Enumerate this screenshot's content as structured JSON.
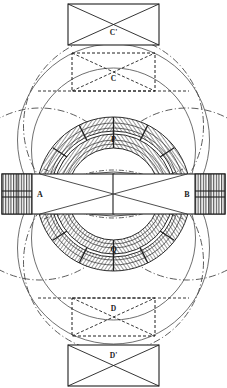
{
  "figure": {
    "caption": "",
    "background_color": "#ffffff",
    "ink_color": "#1a1a1a",
    "shade_color": "#8d8d8d",
    "width": 227,
    "height": 388
  },
  "labels": {
    "top_outer_box": "C'",
    "top_inner_box": "C",
    "bottom_inner_box": "D",
    "bottom_outer_box": "D'",
    "left_terminal": "A",
    "right_terminal": "B",
    "upper_winding": "P",
    "lower_winding": "Q"
  },
  "parts": [
    {
      "id": "C'",
      "name": "upper outer pole piece",
      "style": "solid",
      "shape": "rectangle-with-diagonals"
    },
    {
      "id": "C",
      "name": "upper inner pole piece",
      "style": "dashed",
      "shape": "rectangle-with-diagonals"
    },
    {
      "id": "D",
      "name": "lower inner pole piece",
      "style": "dashed",
      "shape": "rectangle-with-diagonals"
    },
    {
      "id": "D'",
      "name": "lower outer pole piece",
      "style": "solid",
      "shape": "rectangle-with-diagonals"
    },
    {
      "id": "A",
      "name": "left terminal block",
      "style": "solid",
      "shape": "hatched-bar"
    },
    {
      "id": "B",
      "name": "right terminal block",
      "style": "solid",
      "shape": "hatched-bar"
    },
    {
      "id": "P",
      "name": "upper ring winding",
      "style": "hatched-annulus"
    },
    {
      "id": "Q",
      "name": "lower ring winding",
      "style": "hatched-annulus"
    }
  ],
  "construction": {
    "flux_circles": 4,
    "dash_dot_arcs": 4,
    "center_lens": "vesica formed by intersecting arcs"
  }
}
